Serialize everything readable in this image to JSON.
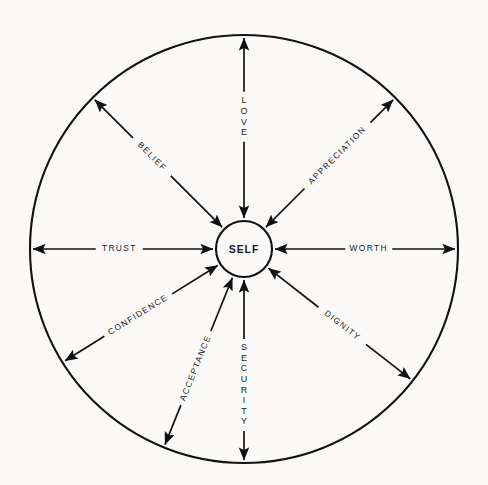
{
  "diagram": {
    "type": "radial-spoke-wheel",
    "title_visible": false,
    "background_color": "#fbfaf8",
    "stroke_color": "#111111",
    "center": {
      "label": "SELF",
      "cx": 244,
      "cy": 249,
      "radius": 28
    },
    "outer_circle": {
      "cx": 244,
      "cy": 249,
      "radius": 214
    },
    "spoke_count": 9,
    "arrow_style": "double-headed",
    "spokes": [
      {
        "label": "LOVE",
        "angle_deg": 90,
        "orientation": "stacked-vertical",
        "label_offset": 0.56,
        "direction": "up"
      },
      {
        "label": "APPRECIATION",
        "angle_deg": 45,
        "orientation": "rotated-along-spoke",
        "label_offset": 0.56,
        "direction": "upper-right"
      },
      {
        "label": "WORTH",
        "angle_deg": 0,
        "orientation": "horizontal",
        "label_offset": 0.52,
        "direction": "right"
      },
      {
        "label": "DIGNITY",
        "angle_deg": -38,
        "orientation": "rotated-along-spoke",
        "label_offset": 0.52,
        "direction": "lower-right"
      },
      {
        "label": "SECURITY",
        "angle_deg": -90,
        "orientation": "stacked-vertical",
        "label_offset": 0.58,
        "direction": "down"
      },
      {
        "label": "ACCEPTANCE",
        "angle_deg": -112,
        "orientation": "rotated-along-spoke",
        "label_offset": 0.54,
        "direction": "lower-left-steep"
      },
      {
        "label": "CONFIDENCE",
        "angle_deg": -148,
        "orientation": "rotated-along-spoke",
        "label_offset": 0.52,
        "direction": "lower-left"
      },
      {
        "label": "TRUST",
        "angle_deg": 180,
        "orientation": "horizontal",
        "label_offset": 0.52,
        "direction": "left"
      },
      {
        "label": "BELIEF",
        "angle_deg": 135,
        "orientation": "rotated-along-spoke",
        "label_offset": 0.55,
        "direction": "upper-left"
      }
    ]
  }
}
